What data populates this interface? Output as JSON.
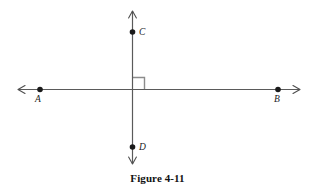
{
  "figure": {
    "caption": "Figure 4-11",
    "colors": {
      "line": "#5a5a5a",
      "point": "#1a1a1a",
      "label": "#1a1a1a",
      "right_angle": "#8c8c8c",
      "background": "#ffffff",
      "caption": "#111111"
    },
    "lines": [
      {
        "id": "horizontal-line",
        "orientation": "horizontal",
        "x1": 18,
        "y1": 89.5,
        "x2": 300,
        "y2": 89.5,
        "arrow_start": true,
        "arrow_end": true
      },
      {
        "id": "vertical-line",
        "orientation": "vertical",
        "x1": 132.5,
        "y1": 11,
        "x2": 132.5,
        "y2": 164,
        "arrow_start": true,
        "arrow_end": true
      }
    ],
    "points": [
      {
        "id": "point-a",
        "label": "A",
        "x": 40,
        "y": 89.5,
        "label_x": 38,
        "label_y": 102,
        "label_anchor": "middle"
      },
      {
        "id": "point-b",
        "label": "B",
        "x": 278,
        "y": 89.5,
        "label_x": 277,
        "label_y": 102,
        "label_anchor": "middle"
      },
      {
        "id": "point-c",
        "label": "C",
        "x": 132.5,
        "y": 32,
        "label_x": 139,
        "label_y": 35,
        "label_anchor": "start"
      },
      {
        "id": "point-d",
        "label": "D",
        "x": 132.5,
        "y": 147,
        "label_x": 139,
        "label_y": 150,
        "label_anchor": "start"
      }
    ],
    "right_angle_marker": {
      "id": "right-angle-marker",
      "quadrant": "upper-right",
      "x": 132.5,
      "y": 89.5,
      "size": 12
    }
  }
}
